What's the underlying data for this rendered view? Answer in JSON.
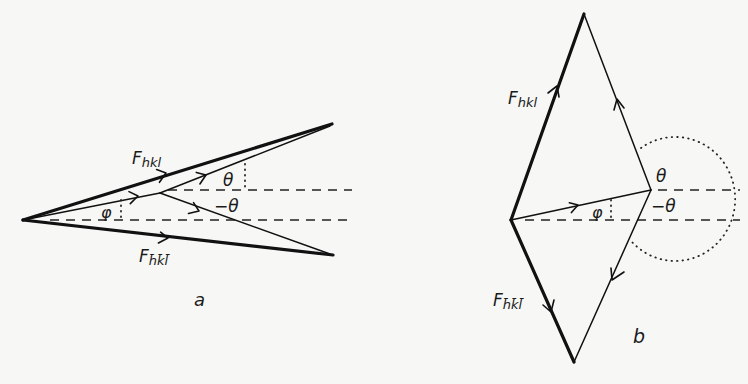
{
  "figure": {
    "panels": [
      {
        "id": "a",
        "caption": "a",
        "labels": {
          "f_hkl": "F",
          "f_hkl_sub": "hkl",
          "f_bar": "F",
          "f_bar_sub": "h̄k̄l̄",
          "theta": "θ",
          "neg_theta": "−θ",
          "phi": "φ"
        }
      },
      {
        "id": "b",
        "caption": "b",
        "labels": {
          "f_hkl": "F",
          "f_hkl_sub": "hkl",
          "f_bar": "F",
          "f_bar_sub": "h̄k̄l̄",
          "theta": "θ",
          "neg_theta": "−θ",
          "phi": "φ"
        }
      }
    ],
    "colors": {
      "ink": "#111111",
      "background": "#f7f7f5"
    }
  }
}
